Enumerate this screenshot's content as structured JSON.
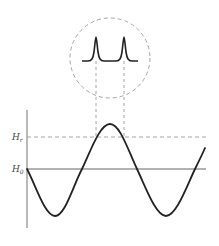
{
  "diagram": {
    "labels": {
      "h_r_main": "H",
      "h_r_sub": "r",
      "h_0_main": "H",
      "h_0_sub": "0"
    },
    "colors": {
      "curve": "#222222",
      "axis": "#8a8a8a",
      "dashed": "#9a9a9a",
      "baseline": "#555555"
    },
    "elements": [
      "vertical axis",
      "H_r dashed threshold line",
      "H_0 solid baseline",
      "sine wave",
      "dashed circle inset",
      "two resonance peaks",
      "two dashed projection lines"
    ]
  }
}
